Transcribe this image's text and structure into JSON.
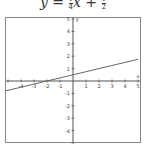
{
  "title": {
    "prefix": "y = ",
    "coef_num": "1",
    "coef_den": "4",
    "var": "x + ",
    "const_num": "1",
    "const_den": "2"
  },
  "chart_data": {
    "type": "line",
    "xlabel": "x",
    "ylabel": "y",
    "xlim": [
      -5.2,
      5
    ],
    "ylim": [
      -5,
      5
    ],
    "grid": false,
    "x_ticks": [
      -4,
      -3,
      -2,
      -1,
      1,
      2,
      3,
      4,
      5
    ],
    "y_ticks": [
      -4,
      -3,
      -2,
      -1,
      1,
      2,
      3,
      4,
      5
    ],
    "series": [
      {
        "name": "y = 1/4 x + 1/2",
        "x": [
          -5.2,
          5
        ],
        "y": [
          -0.8,
          1.75
        ]
      }
    ],
    "colors": {
      "axis": "#555555",
      "line": "#666666",
      "frame": "#888888"
    }
  }
}
